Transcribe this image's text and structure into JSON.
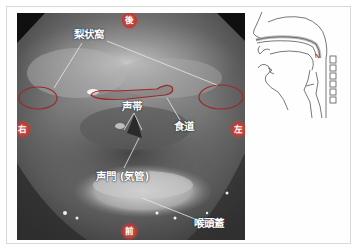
{
  "figure": {
    "type": "endoscopic laryngoscope view with sagittal schematic",
    "directions": {
      "top": "後",
      "bottom": "前",
      "left": "右",
      "right": "左"
    },
    "labels": {
      "piriform_sinus": "梨状窩",
      "vocal_cords": "声帯",
      "esophagus": "食道",
      "glottis": "声門 (気管)",
      "epiglottis": "喉頭蓋"
    },
    "colors": {
      "direction_badge": "#b73a32",
      "outline": "#9a2a28",
      "label_text": "#ffffff",
      "frame_border": "#d8d8d8"
    }
  }
}
